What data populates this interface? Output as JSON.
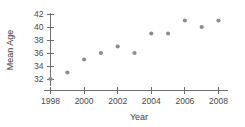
{
  "chart_data": {
    "type": "scatter",
    "title": "",
    "xlabel": "Year",
    "ylabel": "Mean Age",
    "x": [
      1998,
      1999,
      2000,
      2001,
      2002,
      2003,
      2004,
      2005,
      2006,
      2007,
      2008
    ],
    "values": [
      32,
      33,
      35,
      36,
      37,
      36,
      39,
      39,
      41,
      40,
      41
    ],
    "xlim": [
      1997.5,
      2008.5
    ],
    "ylim": [
      31.2,
      42.4
    ],
    "xticks": [
      1998,
      2000,
      2002,
      2004,
      2006,
      2008
    ],
    "xticklabels": [
      "1998",
      "2000",
      "2002",
      "2004",
      "2006",
      "2008"
    ],
    "yticks": [
      32,
      34,
      36,
      38,
      40,
      42
    ],
    "yticklabels": [
      "32",
      "34",
      "36",
      "38",
      "40",
      "42"
    ],
    "grid": false,
    "legend": null,
    "marker_color": "#8c8c8c",
    "axis_color": "#6e6e6e",
    "background": "#ffffff"
  },
  "axes": {
    "y_axis_title": "Mean Age",
    "x_axis_title": "Year"
  }
}
